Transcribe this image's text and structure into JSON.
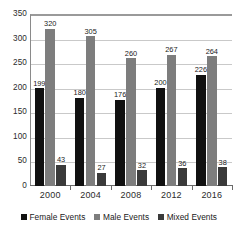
{
  "chart_data": {
    "type": "bar",
    "title": "",
    "subtitle": "",
    "xlabel": "",
    "ylabel": "",
    "categories": [
      "2000",
      "2004",
      "2008",
      "2012",
      "2016"
    ],
    "series": [
      {
        "name": "Female Events",
        "color": "#111111",
        "values": [
          199,
          180,
          176,
          200,
          226
        ]
      },
      {
        "name": "Male Events",
        "color": "#7d7d7d",
        "values": [
          320,
          305,
          260,
          267,
          264
        ]
      },
      {
        "name": "Mixed Events",
        "color": "#3a3a3a",
        "values": [
          43,
          27,
          32,
          36,
          38
        ]
      }
    ],
    "ylim": [
      0,
      350
    ],
    "yticks": [
      0,
      50,
      100,
      150,
      200,
      250,
      300,
      350
    ],
    "ytick_labels": [
      "0",
      "50",
      "100",
      "150",
      "200",
      "250",
      "300",
      "350"
    ],
    "grid": true,
    "grid_axis": "y",
    "legend_position": "bottom",
    "data_labels": true
  },
  "colors": {
    "background": "#ffffff",
    "grid": "#c9c9c9",
    "axis": "#6b6b6b",
    "text": "#1a1a1a"
  }
}
